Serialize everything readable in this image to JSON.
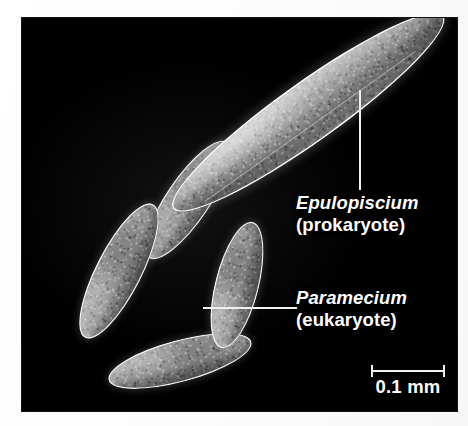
{
  "figure": {
    "kind": "scanning-electron-micrograph",
    "background_color": "#ffffff",
    "field_color": "#000000",
    "annotation_color": "#ffffff"
  },
  "annotations": [
    {
      "id": "epulopiscium",
      "genus": "Epulopiscium",
      "domain_note": "(prokaryote)",
      "leader": "vertical"
    },
    {
      "id": "paramecium",
      "genus": "Paramecium",
      "domain_note": "(eukaryote)",
      "leader": "horizontal"
    }
  ],
  "scale_bar": {
    "label": "0.1 mm",
    "value": 0.1,
    "unit": "mm"
  },
  "specimens": {
    "prokaryote_count": 1,
    "eukaryote_count": 4
  }
}
